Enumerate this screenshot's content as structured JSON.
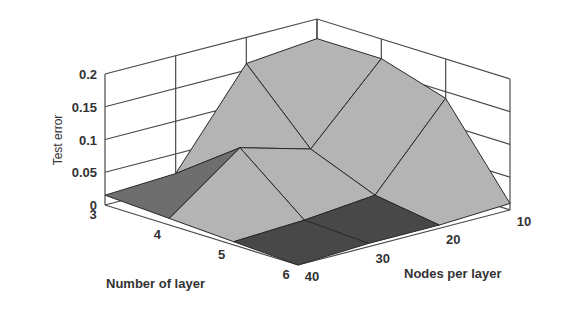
{
  "chart_data": {
    "type": "surface3d",
    "title": "",
    "xlabel": "Number of layer",
    "ylabel": "Nodes per layer",
    "zlabel": "Test error",
    "x": [
      3,
      4,
      5,
      6
    ],
    "y": [
      40,
      30,
      20,
      10
    ],
    "x_tick_labels": [
      "3",
      "4",
      "5",
      "6"
    ],
    "y_tick_labels": [
      "40",
      "30",
      "20",
      "10"
    ],
    "z_tick_labels": [
      "0",
      "0.05",
      "0.1",
      "0.15",
      "0.2"
    ],
    "z_ticks": [
      0,
      0.05,
      0.1,
      0.15,
      0.2
    ],
    "zlim": [
      0,
      0.2
    ],
    "grid": true,
    "z": [
      [
        0.015,
        0.02,
        0.16,
        0.17
      ],
      [
        0.01,
        0.09,
        0.06,
        0.17
      ],
      [
        0.005,
        0.01,
        0.02,
        0.14
      ],
      [
        0.0,
        0.005,
        0.005,
        0.01
      ]
    ],
    "colors": {
      "surface_light": "#b4b4b4",
      "surface_mid": "#6e6e6e",
      "surface_dark": "#484848",
      "grid": "#4a4a4a",
      "edge": "#2a2a2a"
    }
  }
}
